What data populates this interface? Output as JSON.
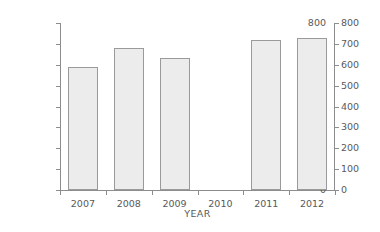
{
  "chart_data": {
    "type": "bar",
    "title": "",
    "subtitle": "",
    "xlabel": "YEAR",
    "ylabel": "Thousand Canadian dollars",
    "categories": [
      "2007",
      "2008",
      "2009",
      "2010",
      "2011",
      "2012"
    ],
    "values": [
      590,
      680,
      632,
      null,
      720,
      730
    ],
    "series": [
      {
        "name": "Thousand Canadian dollars",
        "values": [
          590,
          680,
          632,
          null,
          720,
          730
        ]
      }
    ],
    "ylim": [
      0,
      800
    ],
    "ytick_values": [
      0,
      100,
      200,
      300,
      400,
      500,
      600,
      700,
      800
    ],
    "ytick_labels": [
      "0",
      "100",
      "200",
      "300",
      "400",
      "500",
      "600",
      "700",
      "800"
    ],
    "right_axis": {
      "present": true,
      "ylim": [
        0,
        800
      ],
      "ytick_labels": [
        "0",
        "100",
        "200",
        "300",
        "400",
        "500",
        "600",
        "700",
        "800"
      ]
    },
    "grid": false,
    "legend": null,
    "annotations": [],
    "colors": {
      "bar_fill": "#ececec",
      "bar_border": "#9a9a9a",
      "axis": "#8d8d8d",
      "text": "#58595b",
      "background": "#ffffff"
    }
  }
}
